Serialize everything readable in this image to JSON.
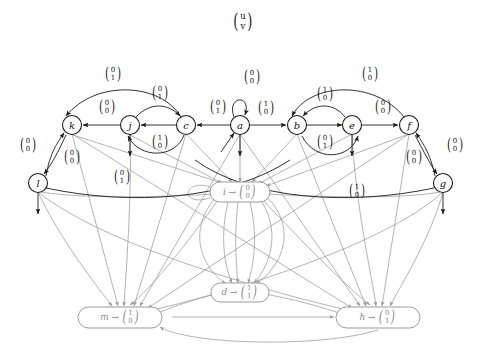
{
  "title_vector": {
    "u": "u",
    "v": "v"
  },
  "colors": {
    "stroke_dark": "#1a1a1a",
    "stroke_light": "#9a9a9a",
    "text": "#111111",
    "muted_text": "#8a8a8a"
  },
  "nodes": [
    {
      "id": "k",
      "label": "k",
      "x": 72,
      "y": 125,
      "shape": "circle"
    },
    {
      "id": "j",
      "label": "j",
      "x": 130,
      "y": 125,
      "shape": "circle"
    },
    {
      "id": "c",
      "label": "c",
      "x": 186,
      "y": 125,
      "shape": "circle"
    },
    {
      "id": "a",
      "label": "a",
      "x": 240,
      "y": 125,
      "shape": "circle"
    },
    {
      "id": "b",
      "label": "b",
      "x": 297,
      "y": 125,
      "shape": "circle"
    },
    {
      "id": "e",
      "label": "e",
      "x": 352,
      "y": 125,
      "shape": "circle"
    },
    {
      "id": "f",
      "label": "f",
      "x": 409,
      "y": 125,
      "shape": "circle"
    },
    {
      "id": "l",
      "label": "l",
      "x": 38,
      "y": 183,
      "shape": "circle"
    },
    {
      "id": "g",
      "label": "g",
      "x": 443,
      "y": 183,
      "shape": "circle"
    },
    {
      "id": "i",
      "label": "i",
      "x": 240,
      "y": 192,
      "shape": "rounded-box",
      "output": {
        "top": "0",
        "bottom": "0"
      }
    },
    {
      "id": "d",
      "label": "d",
      "x": 240,
      "y": 292,
      "shape": "rounded-box",
      "output": {
        "top": "1",
        "bottom": "1"
      }
    },
    {
      "id": "m",
      "label": "m",
      "x": 120,
      "y": 317,
      "shape": "rounded-box",
      "output": {
        "top": "1",
        "bottom": "0"
      }
    },
    {
      "id": "h",
      "label": "h",
      "x": 378,
      "y": 317,
      "shape": "rounded-box",
      "output": {
        "top": "0",
        "bottom": "1"
      }
    }
  ],
  "edge_labels": [
    {
      "id": "lab-c-to-k-top",
      "x": 113,
      "y": 73,
      "top": "0",
      "bottom": "1"
    },
    {
      "id": "lab-j-to-k",
      "x": 107,
      "y": 106,
      "top": "0",
      "bottom": "0"
    },
    {
      "id": "lab-j-to-c-upper",
      "x": 160,
      "y": 92,
      "top": "0",
      "bottom": "1"
    },
    {
      "id": "lab-c-to-j-lower",
      "x": 160,
      "y": 141,
      "top": "1",
      "bottom": "0"
    },
    {
      "id": "lab-a-self",
      "x": 252,
      "y": 76,
      "top": "0",
      "bottom": "0"
    },
    {
      "id": "lab-a-to-c",
      "x": 218,
      "y": 106,
      "top": "0",
      "bottom": "1"
    },
    {
      "id": "lab-a-to-b",
      "x": 266,
      "y": 107,
      "top": "1",
      "bottom": "0"
    },
    {
      "id": "lab-f-to-b-top",
      "x": 370,
      "y": 73,
      "top": "1",
      "bottom": "0"
    },
    {
      "id": "lab-e-to-b",
      "x": 325,
      "y": 93,
      "top": "1",
      "bottom": "0"
    },
    {
      "id": "lab-b-to-e-lower",
      "x": 325,
      "y": 141,
      "top": "0",
      "bottom": "1"
    },
    {
      "id": "lab-e-to-f",
      "x": 383,
      "y": 106,
      "top": "0",
      "bottom": "0"
    },
    {
      "id": "lab-l-to-k",
      "x": 28,
      "y": 144,
      "top": "0",
      "bottom": "0"
    },
    {
      "id": "lab-k-to-l",
      "x": 72,
      "y": 156,
      "top": "0",
      "bottom": "0"
    },
    {
      "id": "lab-f-to-g",
      "x": 455,
      "y": 144,
      "top": "0",
      "bottom": "0"
    },
    {
      "id": "lab-g-to-f",
      "x": 414,
      "y": 156,
      "top": "0",
      "bottom": "0"
    },
    {
      "id": "lab-l-lower",
      "x": 122,
      "y": 176,
      "top": "0",
      "bottom": "1"
    },
    {
      "id": "lab-g-lower",
      "x": 357,
      "y": 190,
      "top": "1",
      "bottom": "0"
    }
  ]
}
